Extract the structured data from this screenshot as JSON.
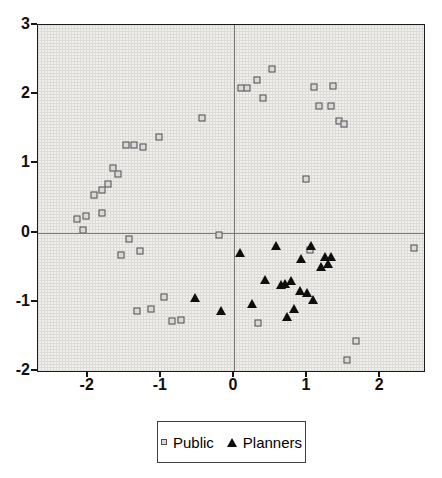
{
  "chart_data": {
    "type": "scatter",
    "title": "",
    "xlabel": "",
    "ylabel": "",
    "xlim": [
      -2.68,
      2.6
    ],
    "ylim": [
      -2,
      3
    ],
    "x_ticks": [
      "-2",
      "-1",
      "0",
      "1",
      "2"
    ],
    "x_tick_values": [
      -2,
      -1,
      0,
      1,
      2
    ],
    "y_ticks": [
      "3",
      "2",
      "1",
      "0",
      "-1",
      "-2"
    ],
    "y_tick_values": [
      3,
      2,
      1,
      0,
      -1,
      -2
    ],
    "grid": "fine graph-paper grid",
    "grid_color": "#dcdbd7",
    "plot_bg_color": "#f0efec",
    "zero_lines": true,
    "zero_line_color": "#7a7a7a",
    "legend_position": "bottom-center",
    "series": [
      {
        "name": "Public",
        "marker": "open-square",
        "fill_color": "#dadada",
        "edge_color": "#4f4f4f",
        "points": [
          [
            -2.07,
            0.04
          ],
          [
            -2.14,
            0.2
          ],
          [
            -2.03,
            0.24
          ],
          [
            -1.92,
            0.55
          ],
          [
            -1.81,
            0.29
          ],
          [
            -1.8,
            0.62
          ],
          [
            -1.72,
            0.7
          ],
          [
            -1.65,
            0.93
          ],
          [
            -1.59,
            0.84
          ],
          [
            -1.48,
            1.26
          ],
          [
            -1.37,
            1.26
          ],
          [
            -1.24,
            1.23
          ],
          [
            -1.02,
            1.38
          ],
          [
            -0.43,
            1.65
          ],
          [
            -1.44,
            -0.09
          ],
          [
            -1.54,
            -0.32
          ],
          [
            -1.29,
            -0.26
          ],
          [
            -0.96,
            -0.93
          ],
          [
            -1.32,
            -1.13
          ],
          [
            -1.13,
            -1.1
          ],
          [
            -0.85,
            -1.28
          ],
          [
            -0.72,
            -1.26
          ],
          [
            -0.21,
            -0.03
          ],
          [
            0.52,
            2.36
          ],
          [
            0.31,
            2.2
          ],
          [
            0.1,
            2.09
          ],
          [
            0.18,
            2.09
          ],
          [
            0.4,
            1.94
          ],
          [
            1.1,
            2.1
          ],
          [
            1.36,
            2.12
          ],
          [
            1.17,
            1.83
          ],
          [
            1.33,
            1.83
          ],
          [
            1.44,
            1.61
          ],
          [
            1.5,
            1.57
          ],
          [
            0.98,
            0.77
          ],
          [
            1.04,
            -0.25
          ],
          [
            0.33,
            -1.31
          ],
          [
            1.67,
            -1.57
          ],
          [
            1.55,
            -1.84
          ],
          [
            2.47,
            -0.22
          ]
        ]
      },
      {
        "name": "Planners",
        "marker": "filled-triangle",
        "fill_color": "#0e0e0e",
        "edge_color": "#0e0e0e",
        "points": [
          [
            -0.53,
            -0.94
          ],
          [
            -0.18,
            -1.13
          ],
          [
            0.08,
            -0.3
          ],
          [
            0.57,
            -0.2
          ],
          [
            1.06,
            -0.2
          ],
          [
            0.92,
            -0.38
          ],
          [
            1.24,
            -0.35
          ],
          [
            1.33,
            -0.35
          ],
          [
            1.19,
            -0.49
          ],
          [
            1.29,
            -0.46
          ],
          [
            0.42,
            -0.68
          ],
          [
            0.64,
            -0.75
          ],
          [
            0.7,
            -0.74
          ],
          [
            0.78,
            -0.7
          ],
          [
            0.9,
            -0.85
          ],
          [
            1.0,
            -0.88
          ],
          [
            1.08,
            -0.97
          ],
          [
            0.25,
            -1.03
          ],
          [
            0.82,
            -1.1
          ],
          [
            0.73,
            -1.22
          ]
        ]
      }
    ]
  },
  "legend": {
    "items": [
      {
        "label": "Public"
      },
      {
        "label": "Planners"
      }
    ]
  }
}
